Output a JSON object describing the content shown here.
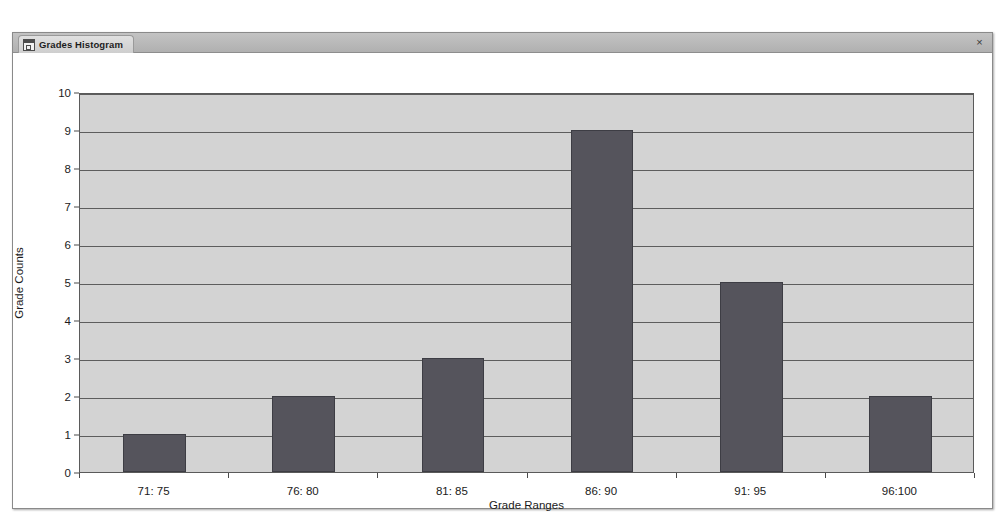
{
  "window": {
    "tab_label": "Grades Histogram",
    "tab_icon": "form-window-icon",
    "close_label": "×"
  },
  "colors": {
    "bar": "#55545c",
    "plot_background": "#d3d3d3",
    "gridline": "#5d5d5d",
    "axis_text": "#1b1b1b",
    "title_bar": "#b8b8b8"
  },
  "chart_data": {
    "type": "bar",
    "title": "",
    "xlabel": "Grade Ranges",
    "ylabel": "Grade Counts",
    "categories": [
      "71: 75",
      "76: 80",
      "81: 85",
      "86: 90",
      "91: 95",
      "96:100"
    ],
    "values": [
      1,
      2,
      3,
      9,
      5,
      2
    ],
    "ylim": [
      0,
      10
    ],
    "yticks": [
      0,
      1,
      2,
      3,
      4,
      5,
      6,
      7,
      8,
      9,
      10
    ],
    "ytick_labels": [
      "0",
      "1",
      "2",
      "3",
      "4",
      "5",
      "6",
      "7",
      "8",
      "9",
      "10"
    ],
    "grid": true,
    "legend": false
  }
}
